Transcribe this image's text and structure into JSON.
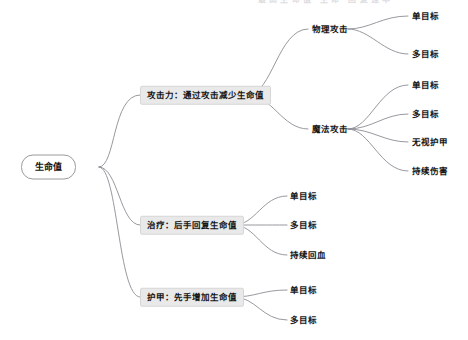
{
  "diagram": {
    "type": "mindmap",
    "title": "生命值",
    "background": "#ffffff",
    "edge_color": "#8c8c94",
    "root_fill": "#ffffff",
    "root_border": "#9a9a9a",
    "category_fill": "#e9e9e9",
    "category_border": "#d6d6d6",
    "text_color": "#151515",
    "clipped_top_row": "最高生命值 生命 回复速率"
  },
  "root": {
    "label": "生命值",
    "x": 60,
    "y": 167
  },
  "categories": [
    {
      "label": "攻击力：通过攻击减少生命值",
      "x": 142,
      "y": 95
    },
    {
      "label": "治疗：后手回复生命值",
      "x": 142,
      "y": 225
    },
    {
      "label": "护甲：先手增加生命值",
      "x": 142,
      "y": 297
    }
  ],
  "subcategories": [
    {
      "label": "物理攻击",
      "x": 313,
      "y": 29,
      "parent": "攻击力：通过攻击减少生命值"
    },
    {
      "label": "魔法攻击",
      "x": 313,
      "y": 129,
      "parent": "攻击力：通过攻击减少生命值"
    }
  ],
  "leaves": [
    {
      "label": "单目标",
      "x": 413,
      "y": 16,
      "parent": "物理攻击"
    },
    {
      "label": "多目标",
      "x": 413,
      "y": 54,
      "parent": "物理攻击"
    },
    {
      "label": "单目标",
      "x": 413,
      "y": 85,
      "parent": "魔法攻击"
    },
    {
      "label": "多目标",
      "x": 413,
      "y": 114,
      "parent": "魔法攻击"
    },
    {
      "label": "无视护甲",
      "x": 413,
      "y": 142,
      "parent": "魔法攻击"
    },
    {
      "label": "持续伤害",
      "x": 413,
      "y": 171,
      "parent": "魔法攻击"
    },
    {
      "label": "单目标",
      "x": 291,
      "y": 196,
      "parent": "治疗：后手回复生命值"
    },
    {
      "label": "多目标",
      "x": 291,
      "y": 225,
      "parent": "治疗：后手回复生命值"
    },
    {
      "label": "持续回血",
      "x": 291,
      "y": 255,
      "parent": "治疗：后手回复生命值"
    },
    {
      "label": "单目标",
      "x": 291,
      "y": 290,
      "parent": "护甲：先手增加生命值"
    },
    {
      "label": "多目标",
      "x": 291,
      "y": 320,
      "parent": "护甲：先手增加生命值"
    }
  ]
}
